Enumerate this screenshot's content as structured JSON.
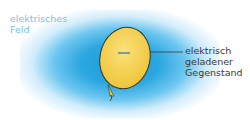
{
  "labels": {
    "field_line1": "elektrisches",
    "field_line2": "Feld",
    "object_line1": "elektrisch",
    "object_line2": "geladener",
    "object_line3": "Gegenstand"
  },
  "balloon": {
    "charge_symbol": "−",
    "fill_color": "#f6d24a",
    "outline_color": "#2d3a2a"
  },
  "field_color": "#2aa6e0"
}
